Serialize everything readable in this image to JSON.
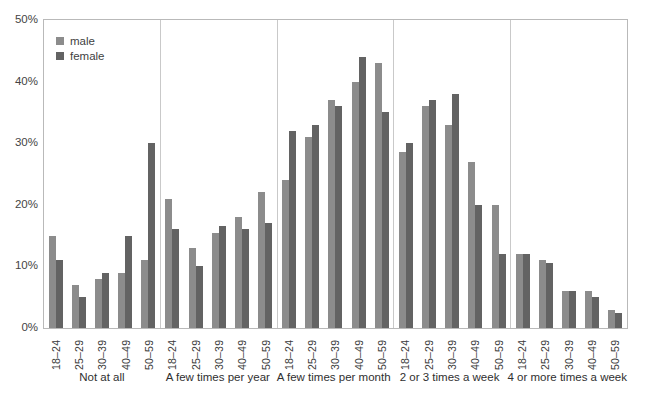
{
  "chart_data": {
    "type": "bar",
    "title": "",
    "xlabel": "",
    "ylabel": "",
    "ylim": [
      0,
      50
    ],
    "yticks": [
      "0%",
      "10%",
      "20%",
      "30%",
      "40%",
      "50%"
    ],
    "ytick_values": [
      0,
      10,
      20,
      30,
      40,
      50
    ],
    "grid": false,
    "legend_position": "top-left-inside",
    "legend": [
      "male",
      "female"
    ],
    "age_bands": [
      "18–24",
      "25–29",
      "30–39",
      "40–49",
      "50–59"
    ],
    "groups": [
      {
        "label": "Not at all",
        "series": [
          {
            "name": "male",
            "values": [
              15,
              7,
              8,
              9,
              11
            ]
          },
          {
            "name": "female",
            "values": [
              11,
              5,
              9,
              15,
              30
            ]
          }
        ]
      },
      {
        "label": "A few times per year",
        "series": [
          {
            "name": "male",
            "values": [
              21,
              13,
              15.5,
              18,
              22
            ]
          },
          {
            "name": "female",
            "values": [
              16,
              10,
              16.5,
              16,
              17
            ]
          }
        ]
      },
      {
        "label": "A few times per month",
        "series": [
          {
            "name": "male",
            "values": [
              24,
              31,
              37,
              40,
              43
            ]
          },
          {
            "name": "female",
            "values": [
              32,
              33,
              36,
              44,
              35
            ]
          }
        ]
      },
      {
        "label": "2 or 3 times a week",
        "series": [
          {
            "name": "male",
            "values": [
              28.5,
              36,
              33,
              27,
              20
            ]
          },
          {
            "name": "female",
            "values": [
              30,
              37,
              38,
              20,
              12
            ]
          }
        ]
      },
      {
        "label": "4 or more times a week",
        "series": [
          {
            "name": "male",
            "values": [
              12,
              11,
              6,
              6,
              3
            ]
          },
          {
            "name": "female",
            "values": [
              12,
              10.5,
              6,
              5,
              2.5
            ]
          }
        ]
      }
    ],
    "colors": {
      "male": "#8c8c8c",
      "female": "#636363"
    }
  }
}
